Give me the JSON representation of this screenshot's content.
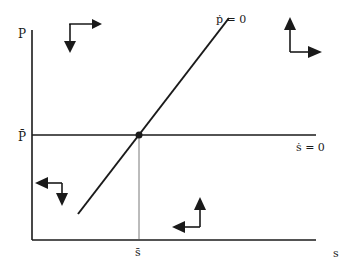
{
  "diagram": {
    "axes": {
      "y_label": "P",
      "x_label": "s",
      "y_tick_label": "P̄",
      "x_tick_label": "s̄"
    },
    "curves": [
      {
        "id": "p-dot-zero",
        "label": "ṗ = 0",
        "kind": "upward-sloping line"
      },
      {
        "id": "s-dot-zero",
        "label": "ṡ = 0",
        "kind": "horizontal line at P̄"
      }
    ],
    "equilibrium": {
      "label": "(s̄, P̄)",
      "marker": "dot"
    },
    "direction_arrows": [
      {
        "region": "upper-left",
        "horizontal": "right",
        "vertical": "down"
      },
      {
        "region": "upper-right",
        "horizontal": "right",
        "vertical": "up"
      },
      {
        "region": "lower-left",
        "horizontal": "left",
        "vertical": "down"
      },
      {
        "region": "lower-right",
        "horizontal": "left",
        "vertical": "up"
      }
    ],
    "colors": {
      "ink": "#1a1a1a",
      "background": "#ffffff",
      "guide": "#555555"
    }
  }
}
